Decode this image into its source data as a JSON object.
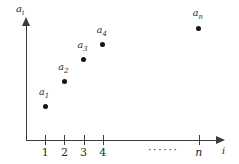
{
  "chart_data": {
    "type": "scatter",
    "title": "",
    "xlabel": "i",
    "ylabel": "a",
    "ylabel_sub": "i",
    "xlabel_full": "i",
    "ylabel_full": "ai",
    "grid": false,
    "legend": null,
    "xlim": [
      0,
      10
    ],
    "ylim": [
      0,
      10
    ],
    "categories": [
      "1",
      "2",
      "3",
      "4",
      "n"
    ],
    "x": [
      1,
      2,
      3,
      4,
      9
    ],
    "values": [
      2.6,
      4.6,
      6.3,
      7.5,
      8.8
    ],
    "point_labels": [
      "a1",
      "a2",
      "a3",
      "a4",
      "an"
    ],
    "point_label_bases": [
      "a",
      "a",
      "a",
      "a",
      "a"
    ],
    "point_label_subs": [
      "1",
      "2",
      "3",
      "4",
      "n"
    ],
    "ellipsis": "······",
    "annotations": []
  },
  "axes": {
    "y_label_base": "a",
    "y_label_sub": "i",
    "x_label": "i"
  },
  "ticks": [
    {
      "label": "1",
      "numeric": true
    },
    {
      "label": "2",
      "numeric": true
    },
    {
      "label": "3",
      "numeric": true
    },
    {
      "label": "4",
      "numeric": true
    },
    {
      "label": "n",
      "numeric": false
    }
  ],
  "points": [
    {
      "label_base": "a",
      "label_sub": "1"
    },
    {
      "label_base": "a",
      "label_sub": "2"
    },
    {
      "label_base": "a",
      "label_sub": "3"
    },
    {
      "label_base": "a",
      "label_sub": "4"
    },
    {
      "label_base": "a",
      "label_sub": "n"
    }
  ],
  "ellipsis_text": "······"
}
